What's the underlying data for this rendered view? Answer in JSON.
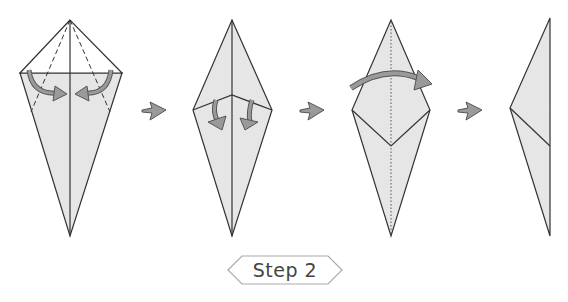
{
  "diagram": {
    "step_label": "Step 2",
    "colors": {
      "paper_fill": "#e6e6e6",
      "paper_white": "#ffffff",
      "line": "#333333",
      "arrow_fill": "#9a9a9a",
      "arrow_stroke": "#555555",
      "label_border": "#aaaaaa"
    },
    "figures": [
      {
        "id": "fig1",
        "description": "Kite base with top flaps folded, dashed valley folds, two curved arrows pointing inward"
      },
      {
        "id": "fig2",
        "description": "Diamond shape with two small curved arrows folding flaps down"
      },
      {
        "id": "fig3",
        "description": "Diamond with inner V crease and dotted center line, large arc arrow folding left to right"
      },
      {
        "id": "fig4",
        "description": "Half-folded shape, result of folding in half"
      }
    ],
    "transition_arrows": [
      "next-step-arrow",
      "next-step-arrow",
      "next-step-arrow"
    ]
  }
}
